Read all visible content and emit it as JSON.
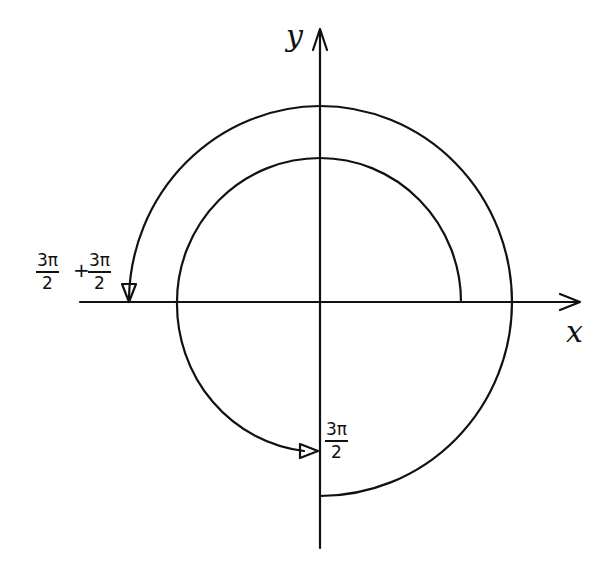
{
  "diagram": {
    "axes": {
      "x_label": "x",
      "y_label": "y"
    },
    "labels": {
      "start_angle": {
        "numerator": "3π",
        "denominator": "2"
      },
      "sum_left": {
        "numerator": "3π",
        "denominator": "2"
      },
      "sum_operator": "+",
      "sum_right": {
        "numerator": "3π",
        "denominator": "2"
      }
    },
    "arcs": [
      {
        "name": "inner-arc",
        "description": "arc from positive x-axis counterclockwise to 3π/2",
        "radius": 143,
        "arrow_at": "negative y-axis"
      },
      {
        "name": "outer-arc",
        "description": "arc from 3π/2 continuing counterclockwise by 3π/2 more",
        "radius": 195,
        "arrow_at": "negative x-axis"
      }
    ],
    "colors": {
      "ink": "#111111",
      "paper": "#ffffff"
    }
  }
}
